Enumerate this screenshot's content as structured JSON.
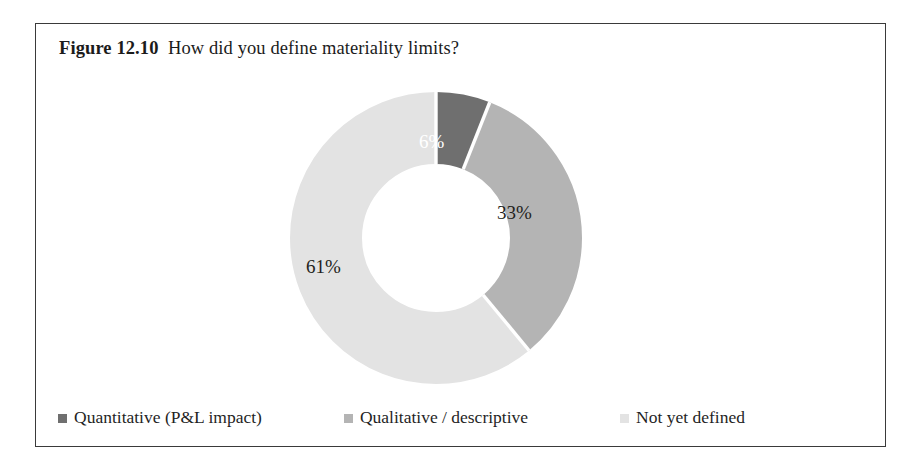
{
  "figure": {
    "label": "Figure 12.10",
    "caption": "How did you define materiality limits?",
    "border_color": "#3a3a3a",
    "background": "#ffffff"
  },
  "chart_data": {
    "type": "pie",
    "variant": "donut",
    "title": "How did you define materiality limits?",
    "xlabel": "",
    "ylabel": "",
    "units": "percent",
    "start_angle_deg": 0,
    "direction": "clockwise",
    "inner_radius_ratio": 0.52,
    "legend_position": "bottom",
    "grid": false,
    "categories": [
      "Quantitative (P&L impact)",
      "Qualitative / descriptive",
      "Not yet defined"
    ],
    "values": [
      6,
      33,
      61
    ],
    "labels": [
      "6%",
      "33%",
      "61%"
    ],
    "colors": [
      "#6f6f6f",
      "#b4b4b4",
      "#e3e3e3"
    ],
    "label_colors": [
      "#ffffff",
      "#231f20",
      "#231f20"
    ],
    "separator_color": "#ffffff"
  },
  "legend": {
    "items": [
      {
        "label": "Quantitative (P&L impact)",
        "color": "#6f6f6f"
      },
      {
        "label": "Qualitative / descriptive",
        "color": "#b4b4b4"
      },
      {
        "label": "Not yet defined",
        "color": "#e3e3e3"
      }
    ]
  }
}
